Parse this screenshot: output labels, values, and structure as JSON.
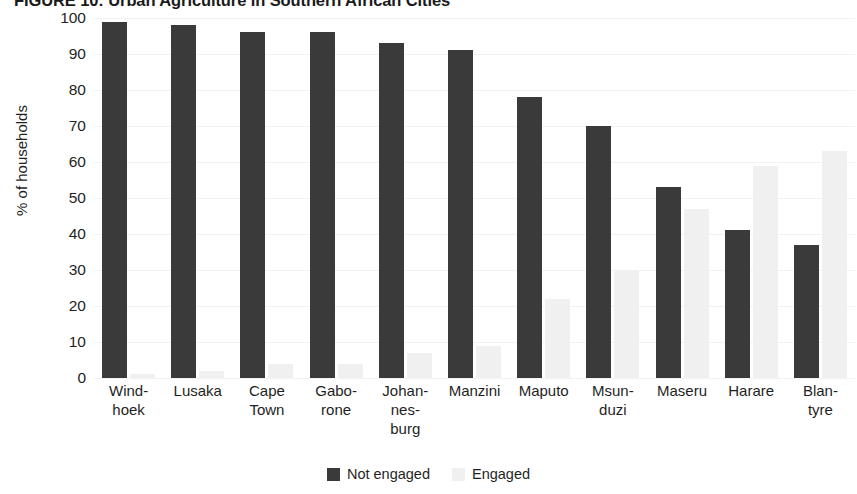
{
  "chart_data": {
    "type": "bar",
    "title": "FIGURE 10: Urban Agriculture in Southern African Cities",
    "xlabel": "",
    "ylabel": "% of households",
    "ylim": [
      0,
      100
    ],
    "ytick_step": 10,
    "ytick_labels": [
      "100",
      "90",
      "80",
      "70",
      "60",
      "50",
      "40",
      "30",
      "20",
      "10",
      "0"
    ],
    "grid": true,
    "grid_axis": "y",
    "legend_position": "bottom-center",
    "bar_mode": "grouped",
    "categories": [
      "Wind-\nhoek",
      "Lusaka",
      "Cape\nTown",
      "Gabo-\nrone",
      "Johan-\nnes-\nburg",
      "Manzini",
      "Maputo",
      "Msun-\nduzi",
      "Maseru",
      "Harare",
      "Blan-\ntyre"
    ],
    "category_lines": [
      [
        "Wind-",
        "hoek"
      ],
      [
        "Lusaka"
      ],
      [
        "Cape",
        "Town"
      ],
      [
        "Gabo-",
        "rone"
      ],
      [
        "Johan-",
        "nes-",
        "burg"
      ],
      [
        "Manzini"
      ],
      [
        "Maputo"
      ],
      [
        "Msun-",
        "duzi"
      ],
      [
        "Maseru"
      ],
      [
        "Harare"
      ],
      [
        "Blan-",
        "tyre"
      ]
    ],
    "series": [
      {
        "name": "Not engaged",
        "color": "#3a3a3a",
        "values": [
          99,
          98,
          96,
          96,
          93,
          91,
          78,
          70,
          53,
          41,
          37
        ]
      },
      {
        "name": "Engaged",
        "color": "#f0f0f0",
        "values": [
          1,
          2,
          4,
          4,
          7,
          9,
          22,
          30,
          47,
          59,
          63
        ]
      }
    ]
  },
  "legend": {
    "items": [
      {
        "label": "Not engaged",
        "swatch": "dark"
      },
      {
        "label": "Engaged",
        "swatch": "light"
      }
    ]
  }
}
